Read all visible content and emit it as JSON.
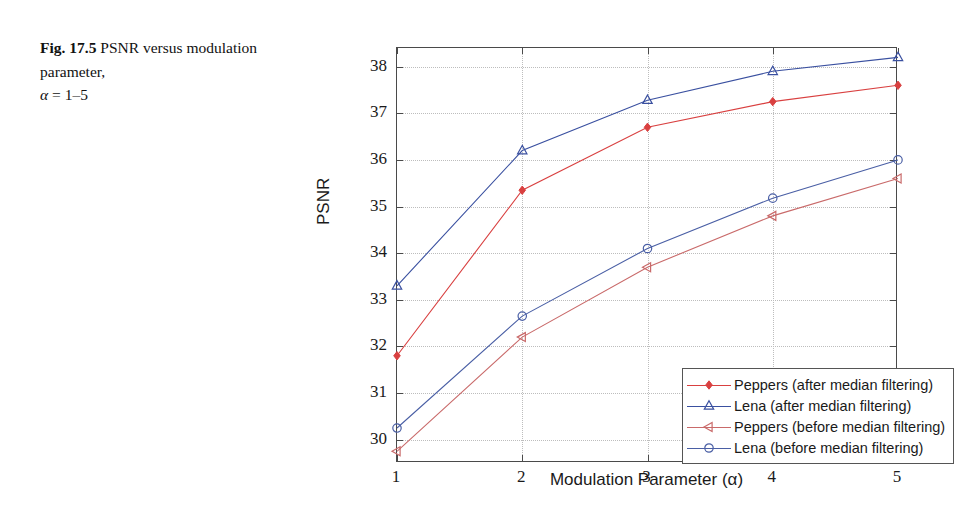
{
  "caption": {
    "fig_label": "Fig. 17.5",
    "text": "PSNR versus modulation parameter,",
    "alpha_symbol": "α",
    "alpha_range": "= 1–5"
  },
  "chart_data": {
    "type": "line",
    "title": "",
    "xlabel": "Modulation Parameter (α)",
    "ylabel": "PSNR",
    "x": [
      1,
      2,
      3,
      4,
      5
    ],
    "xtick_labels": [
      "1",
      "2",
      "3",
      "4",
      "5"
    ],
    "ytick_labels": [
      "30",
      "31",
      "32",
      "33",
      "34",
      "35",
      "36",
      "37",
      "38"
    ],
    "yticks": [
      30,
      31,
      32,
      33,
      34,
      35,
      36,
      37,
      38
    ],
    "xlim": [
      1,
      5
    ],
    "ylim": [
      29.5,
      38.4
    ],
    "grid": true,
    "legend_position": "lower right",
    "series": [
      {
        "name": "Peppers (after median filtering)",
        "values": [
          31.8,
          35.35,
          36.7,
          37.25,
          37.6
        ],
        "color": "#d94040",
        "marker": "diamond-filled"
      },
      {
        "name": "Lena (after median filtering)",
        "values": [
          33.3,
          36.2,
          37.28,
          37.9,
          38.2
        ],
        "color": "#3a50a0",
        "marker": "triangle-up-open"
      },
      {
        "name": "Peppers (before median filtering)",
        "values": [
          29.75,
          32.2,
          33.7,
          34.8,
          35.6
        ],
        "color": "#c96a6a",
        "marker": "triangle-left-open"
      },
      {
        "name": "Lena (before median filtering)",
        "values": [
          30.25,
          32.65,
          34.1,
          35.18,
          36.0
        ],
        "color": "#4a5fa5",
        "marker": "circle-open"
      }
    ]
  }
}
